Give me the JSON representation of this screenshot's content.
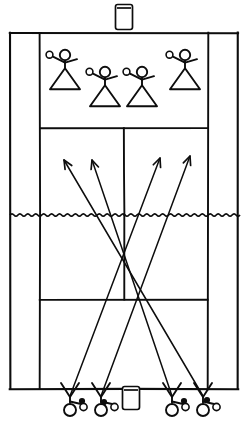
{
  "diagram": {
    "kind": "hand-drawn-sports-court",
    "sport": "badminton",
    "background_color": "#ffffff",
    "ink_color": "#0d0d0d",
    "width": 250,
    "height": 430
  },
  "court": {
    "name": "badminton-court",
    "outer_boundary": {
      "left": 10,
      "top": 33,
      "right": 238,
      "bottom": 389
    },
    "left_sideline_x": 40,
    "right_sideline_x": 208,
    "center_line_x": 124,
    "far_service_line_y": 128,
    "near_service_line_y": 300,
    "net_y": 215,
    "lines": [
      {
        "label": "outer-boundary",
        "type": "rect"
      },
      {
        "label": "left-doubles-sideline",
        "type": "vertical"
      },
      {
        "label": "right-doubles-sideline",
        "type": "vertical"
      },
      {
        "label": "far-service-line",
        "type": "horizontal"
      },
      {
        "label": "near-service-line",
        "type": "horizontal"
      },
      {
        "label": "center-service-line",
        "type": "vertical"
      }
    ]
  },
  "net": {
    "label": "net",
    "y": 215,
    "style": "zigzag",
    "left_x": 10,
    "right_x": 240,
    "segments": 58,
    "amplitude": 2.4
  },
  "far_players": [
    {
      "id": "far-player-1",
      "label": "Far player left",
      "x": 65,
      "y": 55,
      "racket_side": "left"
    },
    {
      "id": "far-player-2",
      "label": "Far player center-left",
      "x": 105,
      "y": 72,
      "racket_side": "left"
    },
    {
      "id": "far-player-3",
      "label": "Far player center-right",
      "x": 142,
      "y": 72,
      "racket_side": "left"
    },
    {
      "id": "far-player-4",
      "label": "Far player right",
      "x": 185,
      "y": 55,
      "racket_side": "left"
    }
  ],
  "near_players": [
    {
      "id": "near-player-1",
      "label": "Near player 1",
      "x": 70,
      "y": 398
    },
    {
      "id": "near-player-2",
      "label": "Near player 2",
      "x": 101,
      "y": 398
    },
    {
      "id": "near-player-3",
      "label": "Near player 3",
      "x": 172,
      "y": 398
    },
    {
      "id": "near-player-4",
      "label": "Near player 4",
      "x": 203,
      "y": 398
    }
  ],
  "shuttle_tubes": [
    {
      "id": "tube-top",
      "label": "Shuttle tube (far side)",
      "x": 124,
      "y": 17,
      "w": 17,
      "h": 25
    },
    {
      "id": "tube-bottom",
      "label": "Shuttle tube (near side)",
      "x": 131,
      "y": 398,
      "w": 17,
      "h": 23
    }
  ],
  "shuttles": [
    {
      "id": "shuttle-1",
      "x": 82,
      "y": 401
    },
    {
      "id": "shuttle-2",
      "x": 104,
      "y": 402
    },
    {
      "id": "shuttle-3",
      "x": 184,
      "y": 401
    },
    {
      "id": "shuttle-4",
      "x": 207,
      "y": 400
    }
  ],
  "trajectories": [
    {
      "id": "trajectory-1",
      "label": "Shot from near-right to far-left",
      "from": {
        "x": 203,
        "y": 396
      },
      "to": {
        "x": 64,
        "y": 160
      },
      "arrow": true
    },
    {
      "id": "trajectory-2",
      "label": "Shot from near-right to far-center-left",
      "from": {
        "x": 172,
        "y": 396
      },
      "to": {
        "x": 92,
        "y": 160
      },
      "arrow": true
    },
    {
      "id": "trajectory-3",
      "label": "Shot from near-left to far-center-right",
      "from": {
        "x": 70,
        "y": 396
      },
      "to": {
        "x": 160,
        "y": 158
      },
      "arrow": true
    },
    {
      "id": "trajectory-4",
      "label": "Shot from near-left to far-right",
      "from": {
        "x": 101,
        "y": 396
      },
      "to": {
        "x": 190,
        "y": 156
      },
      "arrow": true
    }
  ],
  "legend_note": ""
}
